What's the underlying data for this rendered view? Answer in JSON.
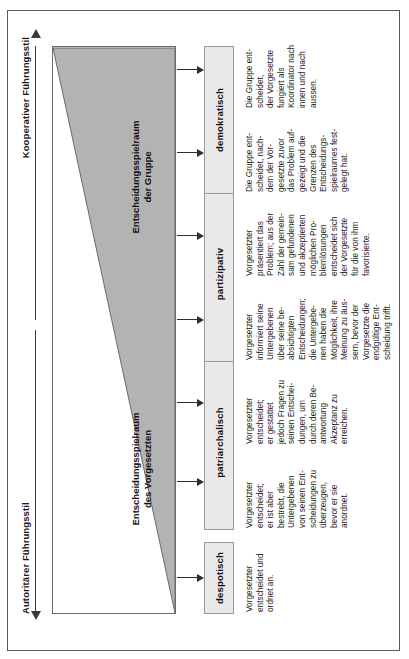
{
  "diagram": {
    "title_left": "Autoritärer Führungsstil",
    "title_right": "Kooperativer Führungsstil",
    "wedge": {
      "left_label": "Entscheidungsspielraum\ndes Vorgesetzten",
      "right_label": "Entscheidungsspielraum\nder Gruppe",
      "fill_color": "#b3b3b3",
      "border_color": "#6b6b6b"
    },
    "styles": [
      {
        "key": "despotisch",
        "label": "despotisch",
        "description": "Vorgesetzter\nentscheidet und\nordnet an."
      },
      {
        "key": "patriarchalisch",
        "label": "patriarchalisch",
        "description": "Vorgesetzter\nentscheidet;\ner ist aber\nbestrebt, die\nUntergebenen\nvon seinen Ent-\nscheidungen zu\nüberzeugen,\nbevor er sie\nanordnet."
      },
      {
        "key": "partizipativ",
        "label": "partizipativ",
        "description": "Vorgesetzter\ninformiert seine\nUntergebenen\nüber seine be-\nabsichtigten\nEntscheidungen;\ndie Untergebe-\nnen haben die\nMöglichkeit, ihre\nMeinung zu äus-\nsern, bevor der\nVorgesetzte die\nendgültige Ent-\nscheidung trifft."
      },
      {
        "key": "demokratisch",
        "label": "demokratisch",
        "description": "Die Gruppe ent-\nscheidet, nach-\ndem der Vor-\ngesetzte zuvor\ndas Problem auf-\ngezeigt und die\nGrenzen des\nEntscheidungs-\nspielraumes fest-\ngelegt hat."
      }
    ],
    "extra_descriptions": [
      {
        "key": "patriarchalisch-right",
        "description": "Vorgesetzter\nentscheidet;\ner gestattet\njedoch Fragen zu\nseinen Entschei-\ndungen, um\ndurch deren Be-\nantwortung\nAkzeptanz zu\nerreichen."
      },
      {
        "key": "partizipativ-right",
        "description": "Vorgesetzter\npräsentiert das\nProblem; aus der\nZahl der gemein-\nsam gefundenen\nund akzeptierten\nmöglichen Pro-\nblemlösungen\nentscheidet sich\nder Vorgesetzte\nfür die von ihm\nfavorisierte."
      },
      {
        "key": "demokratisch-right",
        "description": "Die Gruppe ent-\nscheidet,\nder Vorgesetzte\nfungiert als\nKoordinator nach\ninnen und nach\naussen."
      }
    ]
  }
}
